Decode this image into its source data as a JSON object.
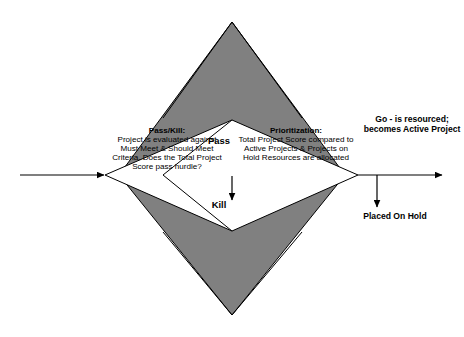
{
  "diagram": {
    "type": "flowchart",
    "colors": {
      "gate_fill": "#808080",
      "stage_fill": "#ffffff",
      "stroke": "#000000",
      "background": "#ffffff",
      "text": "#000000"
    },
    "nodes": {
      "pass_kill": {
        "id": "pass-kill-gate",
        "shape": "diamond",
        "fill": "#ffffff",
        "heading": "Pass/Kill:",
        "body": "Project is evaluated against Must Meet & Should Meet Criteria. Does the Total Project Score pass hurdle?",
        "lines": [
          "Project is evaluated",
          "against Must Meet &",
          "Should Meet Criteria.",
          "Does the Total Project",
          "Score pass hurdle?"
        ]
      },
      "prioritization": {
        "id": "prioritization-gate",
        "shape": "diamond",
        "fill": "#ffffff",
        "heading": "Prioritization:",
        "body": "Total Project Score compared to Active Projects & Projects on Hold Resources are allocated",
        "lines": [
          "Total Project Score",
          "compared to Active",
          "Projects & Projects",
          "on Hold",
          "Resources are",
          "allocated"
        ]
      }
    },
    "labels": {
      "pass": "Pass",
      "kill": "Kill"
    },
    "outcomes": {
      "go": {
        "id": "go-outcome",
        "text": "Go - is resourced; becomes Active Project",
        "lines": [
          "Go - is",
          "resourced;",
          "becomes Active",
          "Project"
        ]
      },
      "hold": {
        "id": "hold-outcome",
        "text": "Placed On Hold",
        "lines": [
          "Placed",
          "On Hold"
        ]
      }
    },
    "connectors": [
      {
        "id": "input-arrow",
        "from": "",
        "to": "pass-kill-gate",
        "direction": "right",
        "label": ""
      },
      {
        "id": "kill-arrow",
        "from": "pass-kill-gate",
        "to": "kill",
        "direction": "down",
        "label": "Kill"
      },
      {
        "id": "go-arrow",
        "from": "prioritization-gate",
        "to": "go-outcome",
        "direction": "right",
        "label": ""
      },
      {
        "id": "hold-arrow",
        "from": "prioritization-gate",
        "to": "hold-outcome",
        "direction": "down",
        "label": ""
      }
    ]
  }
}
